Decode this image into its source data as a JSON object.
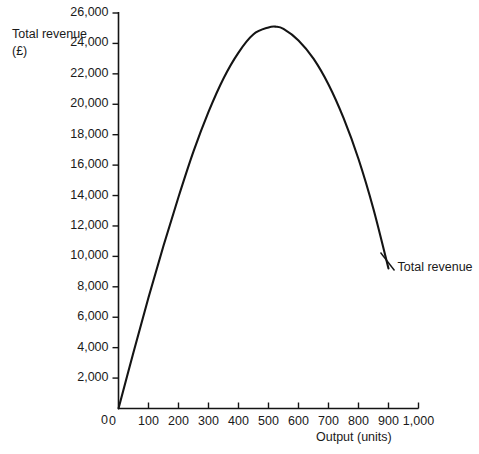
{
  "chart_data": {
    "type": "line",
    "title": "",
    "xlabel": "Output (units)",
    "ylabel": "Total revenue\n(£)",
    "xlim": [
      0,
      1000
    ],
    "ylim": [
      0,
      26000
    ],
    "grid": false,
    "legend_position": "inline-right",
    "x_ticks": [
      0,
      100,
      200,
      300,
      400,
      500,
      600,
      700,
      800,
      900,
      1000
    ],
    "x_tick_labels": [
      "0",
      "100",
      "200",
      "300",
      "400",
      "500",
      "600",
      "700",
      "800",
      "900",
      "1,000"
    ],
    "y_ticks": [
      0,
      2000,
      4000,
      6000,
      8000,
      10000,
      12000,
      14000,
      16000,
      18000,
      20000,
      22000,
      24000,
      26000
    ],
    "y_tick_labels": [
      "0",
      "2,000",
      "4,000",
      "6,000",
      "8,000",
      "10,000",
      "12,000",
      "14,000",
      "16,000",
      "18,000",
      "20,000",
      "22,000",
      "24,000",
      "26,000"
    ],
    "series": [
      {
        "name": "Total revenue",
        "color": "#141414",
        "annotation": "Total revenue",
        "x": [
          0,
          50,
          100,
          150,
          200,
          250,
          300,
          350,
          400,
          450,
          500,
          525,
          550,
          600,
          650,
          700,
          750,
          800,
          850,
          900
        ],
        "values": [
          0,
          3700,
          7300,
          10700,
          13900,
          16900,
          19500,
          21700,
          23400,
          24600,
          25050,
          25100,
          24950,
          24200,
          23000,
          21300,
          19100,
          16400,
          13100,
          9200
        ]
      }
    ]
  },
  "annotations": {
    "series_label": "Total revenue",
    "leader_line": "leader-line-to-curve-end"
  }
}
